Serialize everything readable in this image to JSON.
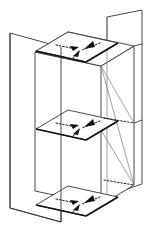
{
  "figure": {
    "title": "Stacked parallelogram planes with convergent arrows",
    "type": "isometric-line-diagram",
    "background_color": "#ffffff",
    "line_color": "#333333",
    "thin_line_color": "#7a7a7a",
    "heavy_edge_color": "#111111",
    "dotted_color": "#1a1a1a",
    "arrow_color": "#111111",
    "level_count": 3,
    "arrows_per_level": 3,
    "vertical_plane_count": 2,
    "levels": [
      {
        "name": "top-level",
        "label": "",
        "plane_y": 34,
        "arrow_directions": [
          "left-to-center",
          "right-to-center",
          "lower-center-up"
        ]
      },
      {
        "name": "middle-level",
        "label": "",
        "plane_y": 114,
        "arrow_directions": [
          "left-to-center",
          "right-to-center",
          "lower-center-up"
        ]
      },
      {
        "name": "bottom-level",
        "label": "",
        "plane_y": 190,
        "arrow_directions": [
          "left-to-center",
          "right-to-center",
          "lower-center-up"
        ]
      }
    ],
    "vertical_planes": [
      {
        "name": "left-vertical-plane",
        "side": "left"
      },
      {
        "name": "right-vertical-plane",
        "side": "right"
      }
    ]
  }
}
